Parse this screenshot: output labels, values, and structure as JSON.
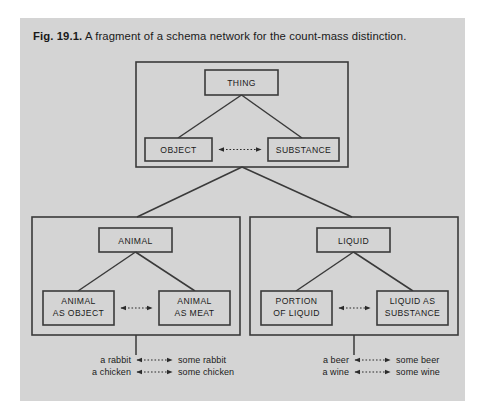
{
  "figure": {
    "caption_label": "Fig. 19.1.",
    "caption_text": "A fragment of a schema network for the count-mass distinction.",
    "background_color": "#d4d4d4",
    "line_color": "#3a3a3a"
  },
  "nodes": {
    "thing": "THING",
    "object": "OBJECT",
    "substance": "SUBSTANCE",
    "animal": "ANIMAL",
    "animal_as_object_line1": "ANIMAL",
    "animal_as_object_line2": "AS OBJECT",
    "animal_as_meat_line1": "ANIMAL",
    "animal_as_meat_line2": "AS MEAT",
    "liquid": "LIQUID",
    "portion_of_liquid_line1": "PORTION",
    "portion_of_liquid_line2": "OF LIQUID",
    "liquid_as_substance_line1": "LIQUID AS",
    "liquid_as_substance_line2": "SUBSTANCE"
  },
  "examples": {
    "left": [
      {
        "count": "a rabbit",
        "mass": "some rabbit"
      },
      {
        "count": "a chicken",
        "mass": "some chicken"
      }
    ],
    "right": [
      {
        "count": "a beer",
        "mass": "some beer"
      },
      {
        "count": "a wine",
        "mass": "some wine"
      }
    ]
  }
}
